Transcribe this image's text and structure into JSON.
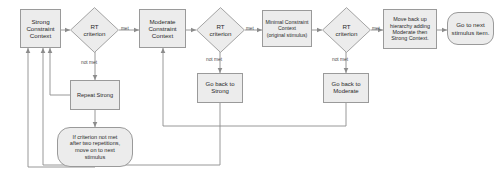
{
  "diagram": {
    "background_color": "#ffffff",
    "node_fill_color": "#ececec",
    "node_border_color": "#9a9a9a",
    "edge_color": "#8c8c8c",
    "text_color": "#2b2b2b"
  },
  "nodes": {
    "strong_context": {
      "label": "Strong\nConstraint\nContext",
      "shape": "rectangle"
    },
    "rt_criterion_1": {
      "label": "RT\ncriterion",
      "shape": "diamond"
    },
    "moderate_context": {
      "label": "Moderate\nConstraint\nContext",
      "shape": "rectangle"
    },
    "rt_criterion_2": {
      "label": "RT\ncriterion",
      "shape": "diamond"
    },
    "minimal_context": {
      "label": "Minimal Constraint\nContext\n(original stimulus)",
      "shape": "rectangle"
    },
    "rt_criterion_3": {
      "label": "RT\ncriterion",
      "shape": "diamond"
    },
    "move_back_up": {
      "label": "Move back up\nhierarchy adding\nModerate then\nStrong Context.",
      "shape": "rectangle"
    },
    "next_stimulus_item": {
      "label": "Go to next\nstimulus item.",
      "shape": "rounded-rectangle"
    },
    "repeat_strong": {
      "label": "Repeat Strong",
      "shape": "rectangle"
    },
    "go_back_strong": {
      "label": "Go back to\nStrong",
      "shape": "rectangle"
    },
    "go_back_moderate": {
      "label": "Go back to\nModerate",
      "shape": "rectangle"
    },
    "two_repetitions_note": {
      "label": "If criterion not met\nafter two repetitions,\nmove on to next\nstimulus",
      "shape": "rounded-rectangle"
    }
  },
  "edge_labels": {
    "met_1": "met",
    "met_2": "met",
    "met_3": "met",
    "not_met_1": "not met",
    "not_met_2": "not met",
    "not_met_3": "not met"
  }
}
